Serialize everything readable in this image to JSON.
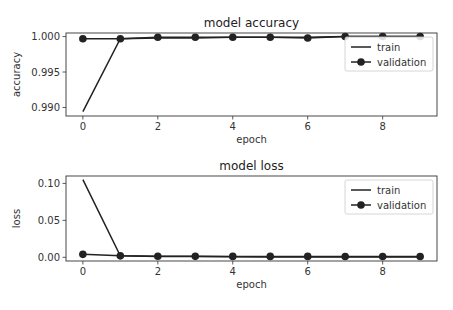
{
  "chart_data": [
    {
      "type": "line",
      "title": "model accuracy",
      "xlabel": "epoch",
      "ylabel": "accuracy",
      "x": [
        0,
        1,
        2,
        3,
        4,
        5,
        6,
        7,
        8,
        9
      ],
      "xlim": [
        -0.45,
        9.45
      ],
      "ylim": [
        0.9888,
        1.0005
      ],
      "xticks": [
        0,
        2,
        4,
        6,
        8
      ],
      "xtick_labels": [
        "0",
        "2",
        "4",
        "6",
        "8"
      ],
      "yticks": [
        0.99,
        0.995,
        1.0
      ],
      "ytick_labels": [
        "0.990",
        "0.995",
        "1.000"
      ],
      "legend": "top-right",
      "series": [
        {
          "name": "train",
          "marker": "none",
          "values": [
            0.9894,
            0.9997,
            0.9998,
            0.9998,
            0.9999,
            0.9999,
            0.9999,
            1.0,
            1.0,
            1.0
          ]
        },
        {
          "name": "validation",
          "marker": "circle",
          "values": [
            0.9997,
            0.9997,
            0.9999,
            0.9999,
            0.9999,
            0.9999,
            0.9998,
            1.0,
            1.0,
            1.0
          ]
        }
      ]
    },
    {
      "type": "line",
      "title": "model loss",
      "xlabel": "epoch",
      "ylabel": "loss",
      "x": [
        0,
        1,
        2,
        3,
        4,
        5,
        6,
        7,
        8,
        9
      ],
      "xlim": [
        -0.45,
        9.45
      ],
      "ylim": [
        -0.005,
        0.11
      ],
      "xticks": [
        0,
        2,
        4,
        6,
        8
      ],
      "xtick_labels": [
        "0",
        "2",
        "4",
        "6",
        "8"
      ],
      "yticks": [
        0.0,
        0.05,
        0.1
      ],
      "ytick_labels": [
        "0.00",
        "0.05",
        "0.10"
      ],
      "legend": "top-right",
      "series": [
        {
          "name": "train",
          "marker": "none",
          "values": [
            0.105,
            0.002,
            0.0012,
            0.0009,
            0.0007,
            0.0006,
            0.0005,
            0.0004,
            0.0003,
            0.0003
          ]
        },
        {
          "name": "validation",
          "marker": "circle",
          "values": [
            0.004,
            0.002,
            0.0015,
            0.0013,
            0.0012,
            0.0012,
            0.0012,
            0.0011,
            0.0011,
            0.0011
          ]
        }
      ]
    }
  ]
}
